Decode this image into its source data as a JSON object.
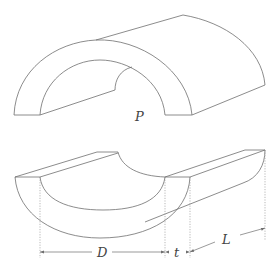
{
  "figure": {
    "labels": {
      "center_point": "P",
      "diameter": "D",
      "thickness": "t",
      "length": "L"
    },
    "colors": {
      "line": "#6e6e6e",
      "label": "#444444",
      "background": "#ffffff"
    }
  }
}
